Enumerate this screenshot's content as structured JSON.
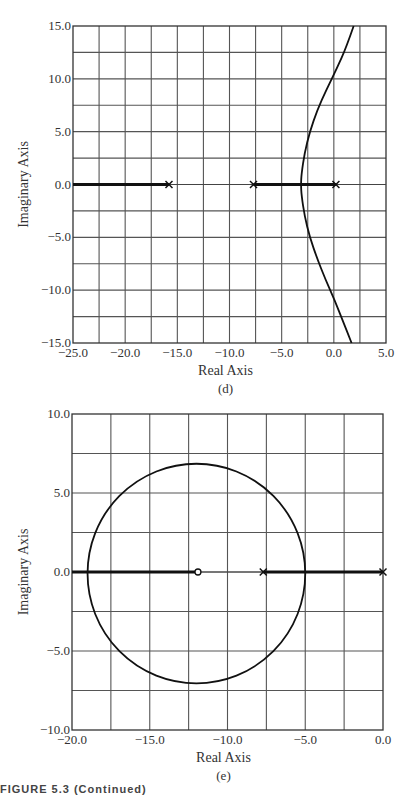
{
  "chart_data": [
    {
      "id": "d",
      "type": "line",
      "subtype": "root-locus",
      "caption": "(d)",
      "xlabel": "Real Axis",
      "ylabel": "Imaginary Axis",
      "xlim": [
        -25,
        5
      ],
      "ylim": [
        -15,
        15
      ],
      "grid": true,
      "grid_step": 2.5,
      "xticks": [
        -25,
        -20,
        -15,
        -10,
        -5,
        0,
        5
      ],
      "xtick_labels": [
        "−25.0",
        "−20.0",
        "−15.0",
        "−10.0",
        "−5.0",
        "0.0",
        "5.0"
      ],
      "yticks": [
        15,
        10,
        5,
        0,
        -5,
        -10,
        -15
      ],
      "ytick_labels": [
        "15.0",
        "10.0",
        "5.0",
        "0.0",
        "−5.0",
        "−10.0",
        "−15.0"
      ],
      "poles": [
        -15.8,
        -7.7,
        0.2
      ],
      "zeros": [],
      "real_axis_segments": [
        [
          -25,
          -15.8
        ],
        [
          -7.7,
          0.2
        ]
      ],
      "branches": [
        {
          "name": "complex branch",
          "points": [
            [
              1.9,
              15
            ],
            [
              1.2,
              13
            ],
            [
              0.3,
              11
            ],
            [
              -0.7,
              9
            ],
            [
              -1.6,
              7
            ],
            [
              -2.3,
              5
            ],
            [
              -2.8,
              3
            ],
            [
              -3.1,
              1
            ],
            [
              -3.15,
              0
            ],
            [
              -3.1,
              -1
            ],
            [
              -2.8,
              -3
            ],
            [
              -2.3,
              -5
            ],
            [
              -1.6,
              -7
            ],
            [
              -0.8,
              -9
            ],
            [
              0.1,
              -11
            ],
            [
              0.9,
              -13
            ],
            [
              1.7,
              -15
            ]
          ]
        }
      ],
      "plot_box_px": {
        "left": 73,
        "right": 386,
        "top": 26,
        "bottom": 343
      }
    },
    {
      "id": "e",
      "type": "line",
      "subtype": "root-locus",
      "caption": "(e)",
      "xlabel": "Real Axis",
      "ylabel": "Imaginary Axis",
      "xlim": [
        -20,
        0
      ],
      "ylim": [
        -10,
        10
      ],
      "grid": true,
      "grid_step": 2.5,
      "xticks": [
        -20,
        -15,
        -10,
        -5,
        0
      ],
      "xtick_labels": [
        "−20.0",
        "−15.0",
        "−10.0",
        "−5.0",
        "0.0"
      ],
      "yticks": [
        10,
        5,
        0,
        -5,
        -10
      ],
      "ytick_labels": [
        "10.0",
        "5.0",
        "0.0",
        "−5.0",
        "−10.0"
      ],
      "poles": [
        -7.7,
        0
      ],
      "zeros": [
        -11.9
      ],
      "real_axis_segments": [
        [
          -20,
          -11.9
        ],
        [
          -7.7,
          0
        ]
      ],
      "branches": [
        {
          "name": "circle",
          "shape": "circle",
          "center": [
            -12.0,
            -0.1
          ],
          "radius_x": 7.0,
          "radius_y": 6.95
        }
      ],
      "plot_box_px": {
        "left": 72,
        "right": 383,
        "top": 414,
        "bottom": 730
      }
    }
  ],
  "figure_caption": "FIGURE 5.3 (Continued)"
}
